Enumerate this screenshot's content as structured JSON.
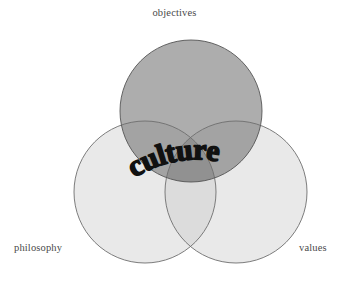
{
  "diagram": {
    "type": "venn",
    "title_word": "culture",
    "background_color": "#ffffff",
    "sets": [
      {
        "id": "objectives",
        "label": "objectives",
        "position": "top",
        "fill_color": "#a6a6a6",
        "stroke_color": "#555555",
        "cx": 191,
        "cy": 111,
        "r": 71
      },
      {
        "id": "philosophy",
        "label": "philosophy",
        "position": "bottom-left",
        "fill_color": "#e9e9e9",
        "stroke_color": "#6e6e6e",
        "cx": 145,
        "cy": 192,
        "r": 71
      },
      {
        "id": "values",
        "label": "values",
        "position": "bottom-right",
        "fill_color": "#e9e9e9",
        "stroke_color": "#6e6e6e",
        "cx": 236,
        "cy": 192,
        "r": 71
      }
    ],
    "intersection_label": "culture",
    "intersection_text_color": "#111111",
    "label_text_color": "#4a4a4a"
  }
}
